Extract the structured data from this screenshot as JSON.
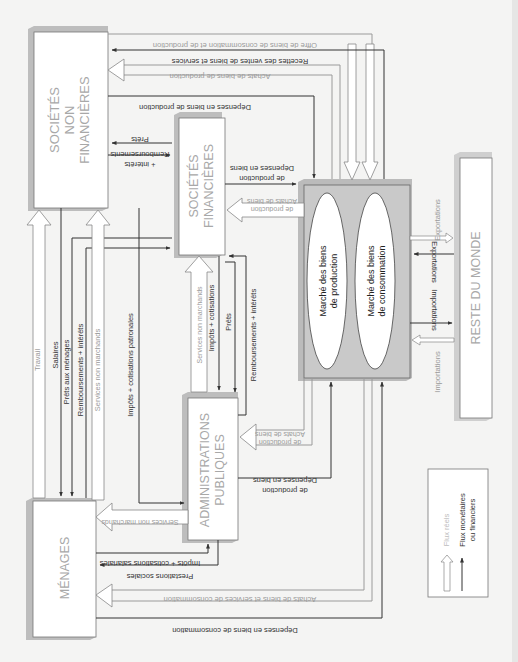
{
  "diagram": {
    "orientation": "rotated 90° (page printed sideways)",
    "colors": {
      "background": "#f4f4f3",
      "box_fill": "#ffffff",
      "box_shadow": "#bdbdbd",
      "market_fill": "#c9c9c9",
      "real_flow": "#9a9a9a",
      "monetary_flow": "#333333",
      "box_label": "#a8a8a8"
    },
    "sectors": {
      "snf": "SOCIÉTÉS NON FINANCIÈRES",
      "snf_l1": "SOCIÉTÉS",
      "snf_l2": "NON",
      "snf_l3": "FINANCIÈRES",
      "sf_l1": "SOCIÉTÉS",
      "sf_l2": "FINANCIÈRES",
      "ap_l1": "ADMINISTRATIONS",
      "ap_l2": "PUBLIQUES",
      "menages": "MÉNAGES",
      "rdm": "RESTE DU MONDE"
    },
    "market": {
      "production_l1": "Marché des biens",
      "production_l2": "de production",
      "consommation_l1": "Marché des biens",
      "consommation_l2": "de consommation"
    },
    "flows": {
      "offre": "Offre de biens de consommation et de production",
      "recettes": "Recettes des ventes de biens et services",
      "achats_prod_snf": "Achats de biens de production",
      "depenses_prod_snf": "Dépenses en biens de production",
      "prets_snf": "Prêts",
      "remb_snf_l1": "Remboursements",
      "remb_snf_l2": "+ intérêts",
      "dep_prod_sf_l1": "Dépenses en biens",
      "dep_prod_sf_l2": "de production",
      "achats_prod_sf_l1": "Achats de biens",
      "achats_prod_sf_l2": "de production",
      "travail": "Travail",
      "salaires": "Salaires",
      "prets_menages": "Prêts aux ménages",
      "remb_menages": "Remboursements + intérêts",
      "services_nm_snf": "Services non marchands",
      "impots_patronales": "Impôts + cotisations patronales",
      "services_nm_sf": "Services non marchands",
      "impots_cotisations_sf": "Impôts + cotisations",
      "prets_ap": "Prêts",
      "remb_ap": "Remboursements + intérêts",
      "achats_prod_ap_l1": "Achats de biens",
      "achats_prod_ap_l2": "de production",
      "dep_prod_ap_l1": "Dépenses en biens",
      "dep_prod_ap_l2": "de production",
      "services_nm_menages": "Services non marchands",
      "impots_salariales": "Impôts + cotisations salariales",
      "prestations": "Prestations sociales",
      "achats_conso": "Achats de biens et services de consommation",
      "depenses_conso": "Dépenses en biens de consommation",
      "exportations_real": "Exportations",
      "exportations_money": "Exportations",
      "importations_money": "Importations",
      "importations_real": "Importations"
    },
    "legend": {
      "real": "Flux réels",
      "money_l1": "Flux monétaires",
      "money_l2": "ou financiers"
    }
  }
}
